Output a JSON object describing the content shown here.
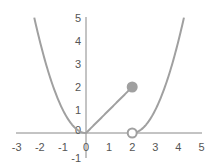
{
  "chart_data": {
    "type": "line",
    "title": "",
    "xlabel": "",
    "ylabel": "",
    "xlim": [
      -3,
      5
    ],
    "ylim": [
      -1,
      5
    ],
    "grid": false,
    "legend": null,
    "x_ticks": [
      "-3",
      "-2",
      "-1",
      "0",
      "1",
      "2",
      "3",
      "4",
      "5"
    ],
    "y_ticks": [
      "5",
      "4",
      "3",
      "2",
      "1",
      "0",
      "-1"
    ],
    "series": [
      {
        "name": "left-parabola",
        "formula": "y = x^2",
        "domain": [
          -2.24,
          0
        ],
        "x": [
          -2.24,
          -2,
          -1.5,
          -1,
          -0.5,
          0
        ],
        "y": [
          5,
          4,
          2.25,
          1,
          0.25,
          0
        ]
      },
      {
        "name": "middle-line",
        "formula": "y = x",
        "domain": [
          0,
          2
        ],
        "x": [
          0,
          2
        ],
        "y": [
          0,
          2
        ]
      },
      {
        "name": "right-parabola",
        "formula": "y = (x-2)^2",
        "domain": [
          2,
          4.24
        ],
        "x": [
          2,
          2.5,
          3,
          3.5,
          4,
          4.24
        ],
        "y": [
          0,
          0.25,
          1,
          2.25,
          4,
          5
        ]
      }
    ],
    "points": [
      {
        "name": "closed-point",
        "x": 2,
        "y": 2,
        "filled": true
      },
      {
        "name": "open-point",
        "x": 2,
        "y": 0,
        "filled": false
      }
    ],
    "colors": {
      "curve": "#a0a0a0",
      "axis": "#888888",
      "text": "#555555"
    }
  }
}
